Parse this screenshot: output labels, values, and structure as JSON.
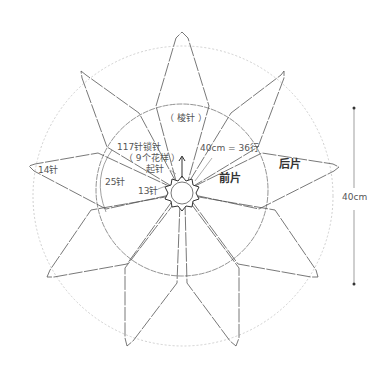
{
  "labels": {
    "garter": "（ 棱针 ）",
    "cast_off_line1": "117针锁针",
    "cast_off_line2": "（ 9个花样 ）",
    "cast_off_line3": "起针",
    "rows": "40cm = 36行",
    "front": "前片",
    "back": "后片",
    "st14": "14针",
    "st25": "25针",
    "st13": "13针",
    "height": "40cm"
  },
  "colors": {
    "line": "#555555",
    "dotted": "#bbbbbb",
    "text": "#555555"
  },
  "geometry": {
    "center": [
      182,
      190
    ],
    "petal_count": 9,
    "hub_radius": 12,
    "inner_circle_radius": 86,
    "outer_circle_radius": 150,
    "dimension_line": {
      "x": 354,
      "y1": 107,
      "y2": 285
    }
  }
}
